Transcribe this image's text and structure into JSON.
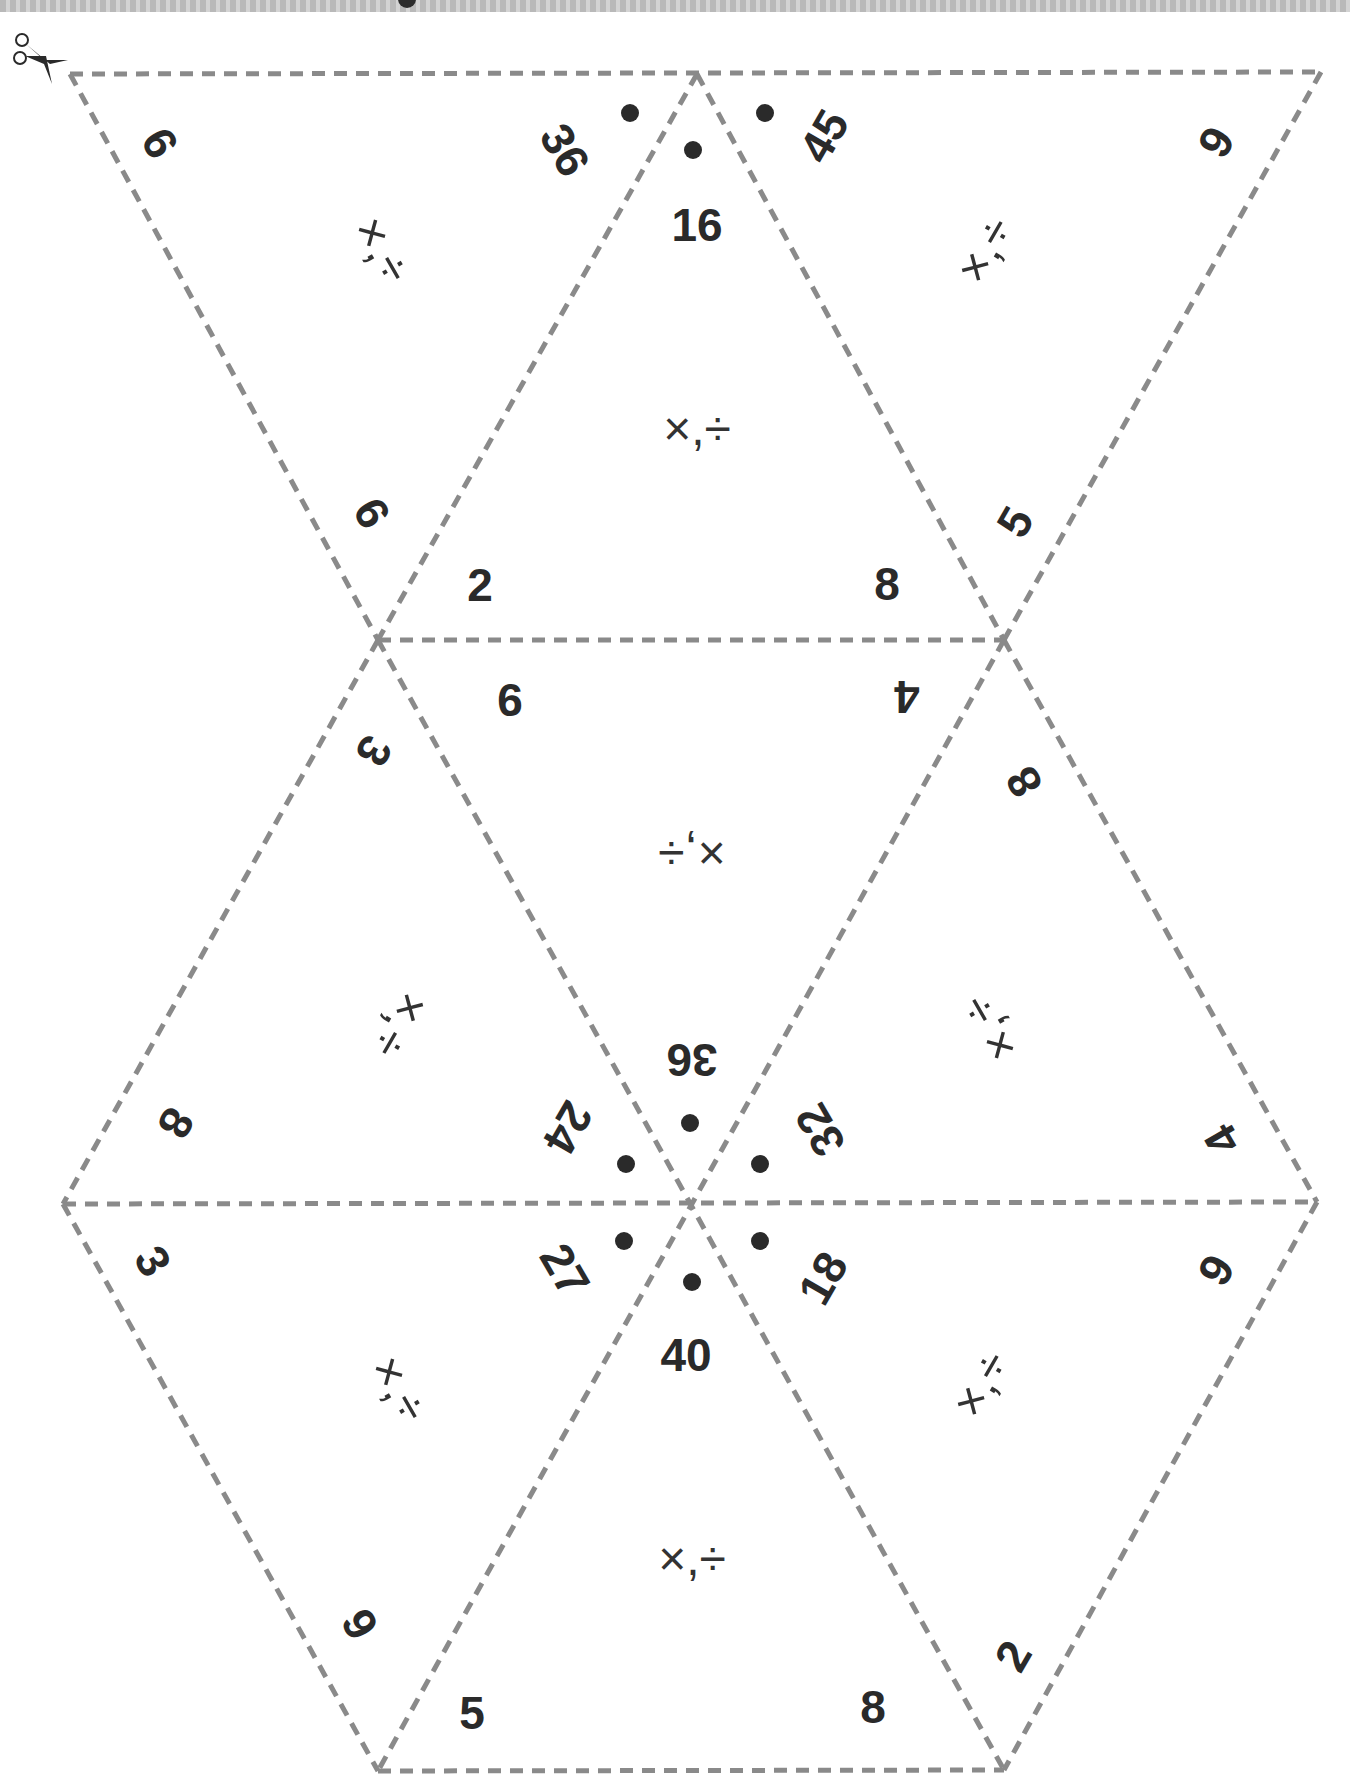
{
  "sheet": {
    "title_fragment": "",
    "cut_line_color": "#8a8a8a",
    "text_color": "#2a2a2a",
    "scissors_icon": "scissors-icon"
  },
  "triangles": [
    {
      "id": "t1",
      "labels": [
        "6",
        "36",
        "6"
      ],
      "operations": "×,÷"
    },
    {
      "id": "t2",
      "labels": [
        "16",
        "2",
        "8"
      ],
      "operations": "×,÷"
    },
    {
      "id": "t3",
      "labels": [
        "45",
        "9",
        "5"
      ],
      "operations": "×,÷"
    },
    {
      "id": "t4",
      "labels": [
        "9",
        "4",
        "36"
      ],
      "operations": "×,÷"
    },
    {
      "id": "t5",
      "labels": [
        "3",
        "8",
        "24"
      ],
      "operations": "×,÷"
    },
    {
      "id": "t6",
      "labels": [
        "8",
        "32",
        "4"
      ],
      "operations": "×,÷"
    },
    {
      "id": "t7",
      "labels": [
        "3",
        "27",
        "9"
      ],
      "operations": "×,÷"
    },
    {
      "id": "t8",
      "labels": [
        "40",
        "5",
        "8"
      ],
      "operations": "×,÷"
    },
    {
      "id": "t9",
      "labels": [
        "18",
        "9",
        "2"
      ],
      "operations": "×,÷"
    }
  ]
}
